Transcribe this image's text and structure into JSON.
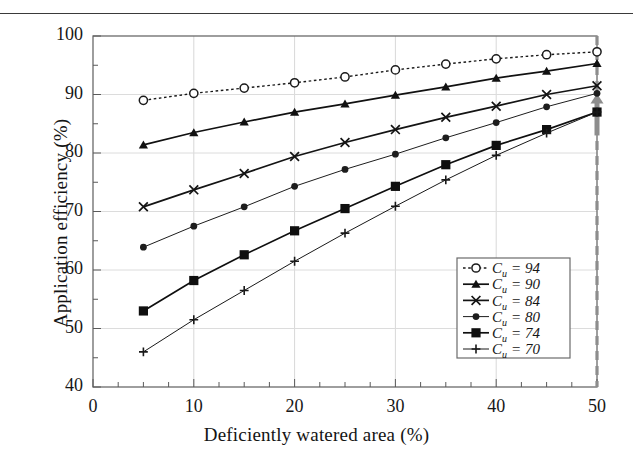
{
  "chart_data": {
    "type": "line",
    "title": "",
    "xlabel": "Deficiently watered area (%)",
    "ylabel": "Application efficiency (%)",
    "xlim": [
      0,
      50
    ],
    "ylim": [
      40,
      100
    ],
    "xticks": [
      0,
      10,
      20,
      30,
      40,
      50
    ],
    "yticks": [
      40,
      50,
      60,
      70,
      80,
      90,
      100
    ],
    "x_minor_step": 2.5,
    "y_minor_step": 5,
    "grid": true,
    "legend_position": "lower-right-inside",
    "x": [
      5,
      10,
      15,
      20,
      25,
      30,
      35,
      40,
      45,
      50
    ],
    "series": [
      {
        "name": "C_u = 94",
        "label_main": "C",
        "label_sub": "u",
        "label_value": "= 94",
        "marker": "open-circle",
        "line_style": "dotted",
        "color": "#1a1a1a",
        "values": [
          89.0,
          90.2,
          91.1,
          92.0,
          93.0,
          94.2,
          95.2,
          96.1,
          96.8,
          97.3
        ]
      },
      {
        "name": "C_u = 90",
        "label_main": "C",
        "label_sub": "u",
        "label_value": "= 90",
        "marker": "filled-triangle",
        "line_style": "solid",
        "color": "#111111",
        "values": [
          81.4,
          83.5,
          85.3,
          87.0,
          88.4,
          89.9,
          91.3,
          92.8,
          94.0,
          95.3
        ]
      },
      {
        "name": "C_u = 84",
        "label_main": "C",
        "label_sub": "u",
        "label_value": "= 84",
        "marker": "cross-x",
        "line_style": "solid",
        "color": "#141414",
        "values": [
          70.8,
          73.7,
          76.5,
          79.4,
          81.8,
          84.0,
          86.1,
          88.0,
          90.0,
          91.5
        ]
      },
      {
        "name": "C_u = 80",
        "label_main": "C",
        "label_sub": "u",
        "label_value": "= 80",
        "marker": "small-filled-circle",
        "line_style": "thin",
        "color": "#1d1d1d",
        "values": [
          63.9,
          67.5,
          70.8,
          74.3,
          77.2,
          79.8,
          82.6,
          85.2,
          87.9,
          90.2
        ]
      },
      {
        "name": "C_u = 74",
        "label_main": "C",
        "label_sub": "u",
        "label_value": "= 74",
        "marker": "filled-square",
        "line_style": "solid",
        "color": "#0f0f0f",
        "values": [
          53.0,
          58.2,
          62.6,
          66.7,
          70.5,
          74.3,
          78.0,
          81.3,
          84.0,
          87.0
        ]
      },
      {
        "name": "C_u = 70",
        "label_main": "C",
        "label_sub": "u",
        "label_value": "= 70",
        "marker": "plus",
        "line_style": "thin",
        "color": "#191919",
        "values": [
          46.0,
          51.5,
          56.5,
          61.5,
          66.3,
          70.9,
          75.4,
          79.6,
          83.4,
          87.0
        ]
      }
    ],
    "annotations": [
      {
        "name": "target-line",
        "type": "vertical-dashed-line",
        "x": 50,
        "color": "#8d8d8d"
      },
      {
        "name": "up-arrow",
        "type": "arrow-up",
        "x": 50,
        "y_from": 83,
        "y_to": 90,
        "color": "#8d8d8d"
      }
    ]
  },
  "axis": {
    "x_tick_labels": [
      "0",
      "10",
      "20",
      "30",
      "40",
      "50"
    ],
    "y_tick_labels": [
      "40",
      "50",
      "60",
      "70",
      "80",
      "90",
      "100"
    ],
    "xlabel": "Deficiently watered area (%)",
    "ylabel": "Application efficiency (%)"
  }
}
